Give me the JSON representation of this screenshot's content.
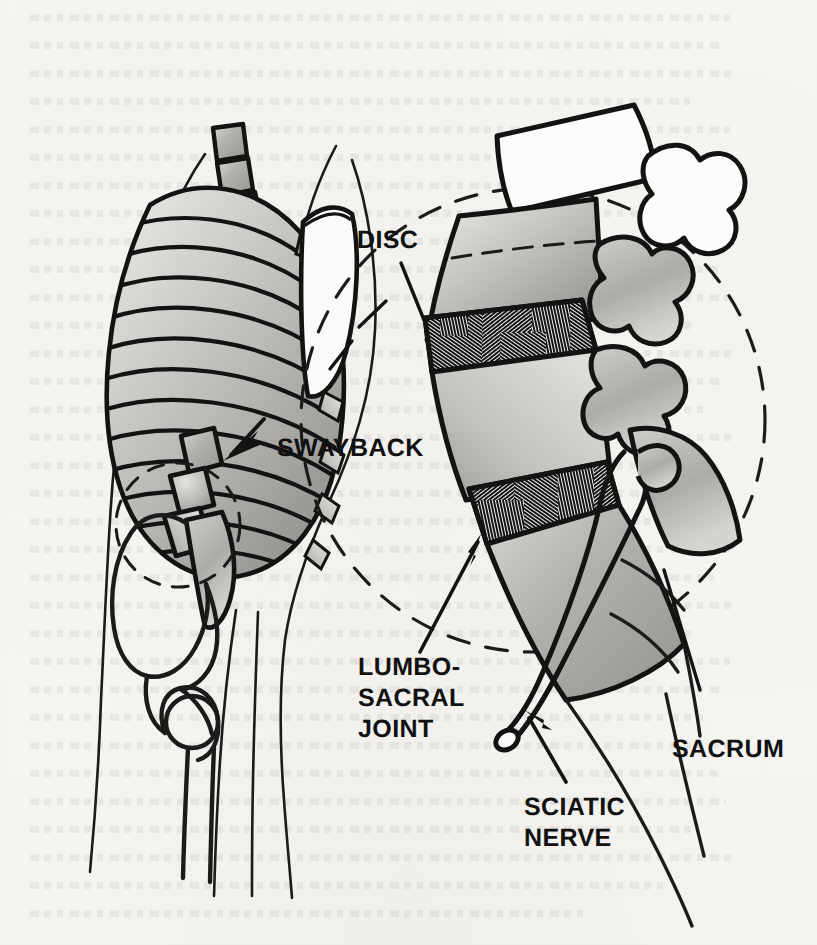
{
  "page": {
    "kind": "scanned-book-illustration",
    "width": 817,
    "height": 945,
    "background_color": "#f6f5f2",
    "ink_color": "#111111",
    "has_reverse_side_showthrough": true
  },
  "figure": {
    "title_visible": false,
    "left_panel_name": "skeleton-profile-view",
    "right_panel_name": "lumbosacral-magnified-detail"
  },
  "labels": {
    "swayback": "SWAYBACK",
    "disc": "DISC",
    "lumbosacral_joint_line1": "LUMBO-",
    "lumbosacral_joint_line2": "SACRAL",
    "lumbosacral_joint_line3": "JOINT",
    "sacrum": "SACRUM",
    "sciatic_nerve_line1": "SCIATIC",
    "sciatic_nerve_line2": "NERVE"
  },
  "callouts": [
    {
      "name": "swayback",
      "text": "SWAYBACK",
      "pointer": "solid-arrowhead",
      "direction": "left",
      "target": "lumbar-lordosis-curve"
    },
    {
      "name": "disc",
      "text": "DISC",
      "pointer": "thin-leader-line",
      "direction": "down-right",
      "target": "intervertebral-disc-upper"
    },
    {
      "name": "lumbosacral-joint",
      "text": "LUMBO-SACRAL JOINT",
      "pointer": "thin-arrow",
      "direction": "up-right",
      "target": "lumbosacral-junction"
    },
    {
      "name": "sciatic-nerve",
      "text": "SCIATIC NERVE",
      "pointer": "thin-arrow",
      "direction": "up-left",
      "target": "sciatic-nerve-root"
    },
    {
      "name": "sacrum",
      "text": "SACRUM",
      "pointer": "thin-leader-line",
      "direction": "up-left",
      "target": "sacrum-body"
    }
  ],
  "anatomy": {
    "left_panel_parts": [
      "thoracic-vertebrae",
      "rib-cage",
      "scapula",
      "lumbar-vertebrae",
      "sacrum",
      "pelvis-ilium",
      "femur-head",
      "femur-shaft",
      "body-outline"
    ],
    "right_panel_parts": [
      "upper-vertebral-body",
      "upper-spinous-process",
      "lumbar-vertebral-body-l5",
      "intervertebral-disc-upper",
      "intervertebral-disc-lower",
      "sacrum",
      "facet-processes",
      "sciatic-nerve"
    ],
    "magnifier_circle": {
      "name": "magnification-circle",
      "style": "dashed",
      "center_x": 533,
      "center_y": 420,
      "radius": 232
    },
    "detail_circle": {
      "name": "detail-region-circle",
      "style": "dashed",
      "center_x": 178,
      "center_y": 525,
      "radius": 62
    }
  },
  "shading": {
    "bone_light": "#c9c7c4",
    "bone_mid": "#a8a6a3",
    "bone_dark": "#8e8c89",
    "disc_hatch": "#161616",
    "white": "#fbfaf8"
  }
}
